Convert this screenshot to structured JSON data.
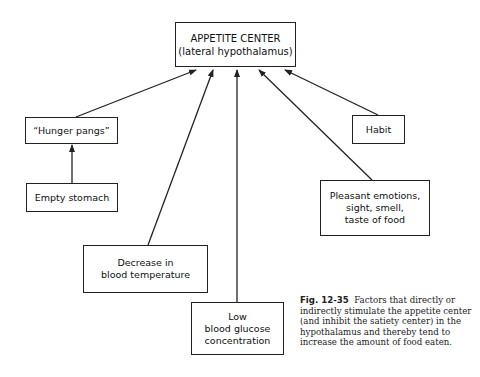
{
  "diagram": {
    "center": {
      "line1": "APPETITE CENTER",
      "line2": "(lateral hypothalamus)"
    },
    "nodes": {
      "hunger_pangs": {
        "label": "“Hunger pangs”"
      },
      "empty_stomach": {
        "label": "Empty stomach"
      },
      "blood_temp": {
        "line1": "Decrease in",
        "line2": "blood temperature"
      },
      "blood_glucose": {
        "line1": "Low",
        "line2": "blood glucose",
        "line3": "concentration"
      },
      "emotions": {
        "line1": "Pleasant emotions,",
        "line2": "sight, smell,",
        "line3": "taste of food"
      },
      "habit": {
        "label": "Habit"
      }
    },
    "edges": [
      {
        "from": "empty_stomach",
        "to": "hunger_pangs"
      },
      {
        "from": "hunger_pangs",
        "to": "center"
      },
      {
        "from": "blood_temp",
        "to": "center"
      },
      {
        "from": "blood_glucose",
        "to": "center"
      },
      {
        "from": "emotions",
        "to": "center"
      },
      {
        "from": "habit",
        "to": "center"
      }
    ]
  },
  "caption": {
    "label": "Fig. 12-35",
    "text": "Factors that directly or indirectly stimulate the appetite center (and inhibit the satiety center) in the hypothalamus and thereby tend to increase the amount of food eaten."
  }
}
